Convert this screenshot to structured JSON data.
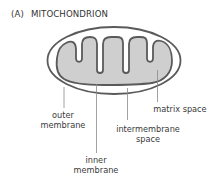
{
  "figure": {
    "tag": "(A)",
    "title": "MITOCHONDRION"
  },
  "labels": {
    "outer_membrane": {
      "line1": "outer",
      "line2": "membrane"
    },
    "inner_membrane": {
      "line1": "inner",
      "line2": "membrane"
    },
    "intermembrane_space": {
      "line1": "intermembrane",
      "line2": "space"
    },
    "matrix_space": {
      "line1": "matrix space"
    }
  },
  "colors": {
    "membrane_stroke": "#5a5a5a",
    "matrix_fill": "#cfcfcf",
    "background": "#ffffff",
    "leader_line": "#8a8a8a"
  }
}
